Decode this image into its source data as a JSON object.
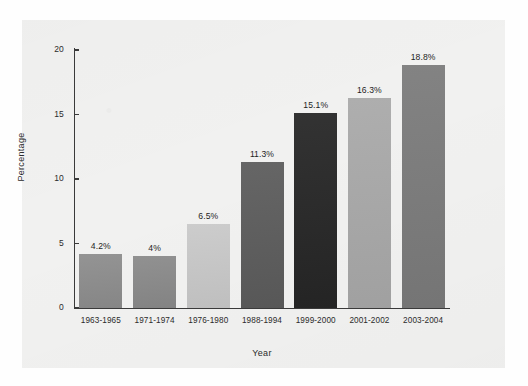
{
  "chart_data": {
    "type": "bar",
    "title": "",
    "xlabel": "Year",
    "ylabel": "Percentage",
    "categories": [
      "1963-1965",
      "1971-1974",
      "1976-1980",
      "1988-1994",
      "1999-2000",
      "2001-2002",
      "2003-2004"
    ],
    "values": [
      4.2,
      4,
      6.5,
      11.3,
      15.1,
      16.3,
      18.8
    ],
    "value_labels": [
      "4.2%",
      "4%",
      "6.5%",
      "11.3%",
      "15.1%",
      "16.3%",
      "18.8%"
    ],
    "bar_colors": [
      "#8d8d8d",
      "#8a8a8a",
      "#c9c9c9",
      "#5c5c5c",
      "#262626",
      "#a9a9a9",
      "#7b7b7b"
    ],
    "ylim": [
      0,
      20
    ],
    "yticks": [
      0,
      5,
      10,
      15,
      20
    ],
    "ytick_labels": [
      "0",
      "5",
      "10",
      "15",
      "20"
    ],
    "grid": false,
    "legend": false,
    "legend_position": "none",
    "panel_background": "#f1f1f0",
    "page_background": "#ffffff",
    "axis_color": "#3a3a3a",
    "text_color": "#2b2b2b"
  }
}
